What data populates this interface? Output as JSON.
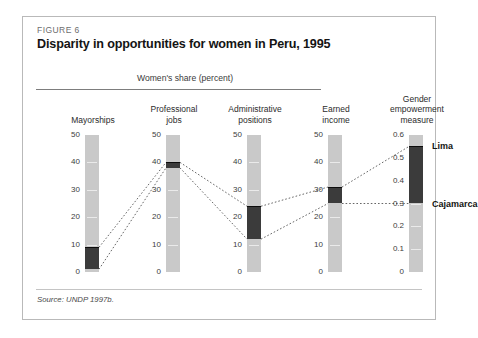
{
  "figure": {
    "label": "FIGURE 6",
    "title": "Disparity in opportunities for women in Peru, 1995",
    "share_caption": "Women's share (percent)",
    "source": "Source: UNDP 1997b."
  },
  "colors": {
    "track": "#c9c9c9",
    "segment": "#3b3b3b",
    "segment_cap": "#0c0c0c",
    "rule": "#7d7d7d",
    "frame": "#b9b9b9",
    "connector": "#555555"
  },
  "chart_data": {
    "type": "bar",
    "title": "Disparity in opportunities for women in Peru, 1995",
    "subtitle": "Women's share (percent)",
    "xlabel": "",
    "ylabel": "Women's share (percent)",
    "grid": false,
    "legend_position": "right-inline",
    "source": "Source: UNDP 1997b.",
    "categories": [
      "Mayorships",
      "Professional jobs",
      "Administrative positions",
      "Earned income",
      "Gender empowerment measure"
    ],
    "columns": [
      {
        "name": "Mayorships",
        "header_lines": [
          "Mayorships"
        ],
        "ylim": [
          0,
          50
        ],
        "ticks": [
          0,
          10,
          20,
          30,
          40,
          50
        ],
        "tick_labels": [
          "0",
          "10",
          "20",
          "30",
          "40",
          "50"
        ],
        "range_low": 1,
        "range_high": 9,
        "unit": "percent"
      },
      {
        "name": "Professional jobs",
        "header_lines": [
          "Professional",
          "jobs"
        ],
        "ylim": [
          0,
          50
        ],
        "ticks": [
          0,
          10,
          20,
          30,
          40,
          50
        ],
        "tick_labels": [
          "0",
          "10",
          "20",
          "30",
          "40",
          "50"
        ],
        "range_low": 38,
        "range_high": 40,
        "unit": "percent"
      },
      {
        "name": "Administrative positions",
        "header_lines": [
          "Administrative",
          "positions"
        ],
        "ylim": [
          0,
          50
        ],
        "ticks": [
          0,
          10,
          20,
          30,
          40,
          50
        ],
        "tick_labels": [
          "0",
          "10",
          "20",
          "30",
          "40",
          "50"
        ],
        "range_low": 12,
        "range_high": 24,
        "unit": "percent"
      },
      {
        "name": "Earned income",
        "header_lines": [
          "Earned",
          "income"
        ],
        "ylim": [
          0,
          50
        ],
        "ticks": [
          0,
          10,
          20,
          30,
          40,
          50
        ],
        "tick_labels": [
          "0",
          "10",
          "20",
          "30",
          "40",
          "50"
        ],
        "range_low": 25,
        "range_high": 31,
        "unit": "percent"
      },
      {
        "name": "Gender empowerment measure",
        "header_lines": [
          "Gender",
          "empowerment",
          "measure"
        ],
        "ylim": [
          0,
          0.6
        ],
        "ticks": [
          0,
          0.1,
          0.2,
          0.3,
          0.4,
          0.5,
          0.6
        ],
        "tick_labels": [
          "0",
          "0.1",
          "0.2",
          "0.3",
          "0.4",
          "0.5",
          "0.6"
        ],
        "range_low": 0.3,
        "range_high": 0.55,
        "unit": "index",
        "endpoint_labels": [
          {
            "name": "Lima",
            "value": 0.55
          },
          {
            "name": "Cajamarca",
            "value": 0.3
          }
        ]
      }
    ],
    "connectors": [
      {
        "series": "high",
        "points": [
          9,
          40,
          24,
          31,
          0.55
        ]
      },
      {
        "series": "low",
        "points": [
          1,
          38,
          12,
          25,
          0.3
        ]
      }
    ]
  }
}
